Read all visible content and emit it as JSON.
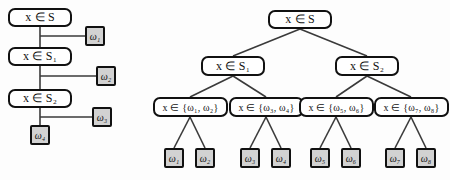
{
  "figure": {
    "background_color": "#fdfdfd",
    "ink_color": "#111111",
    "leaf_fill_color": "#d2d2d2",
    "node_fill_color": "#ffffff"
  },
  "left_tree": {
    "name": "degenerate-cascade-tree",
    "edge_style": "orthogonal",
    "decision_nodes": [
      {
        "id": "L-d1",
        "label": "x ∈ S",
        "var": "x",
        "op": "∈",
        "set": "S",
        "sub": ""
      },
      {
        "id": "L-d2",
        "label": "x ∈ S₁",
        "var": "x",
        "op": "∈",
        "set": "S",
        "sub": "1"
      },
      {
        "id": "L-d3",
        "label": "x ∈ S₂",
        "var": "x",
        "op": "∈",
        "set": "S",
        "sub": "2"
      }
    ],
    "leaves": [
      {
        "id": "L-w1",
        "label": "ω₁",
        "sym": "ω",
        "sub": "1"
      },
      {
        "id": "L-w2",
        "label": "ω₂",
        "sym": "ω",
        "sub": "2"
      },
      {
        "id": "L-w3",
        "label": "ω₃",
        "sym": "ω",
        "sub": "3"
      },
      {
        "id": "L-w4",
        "label": "ω₄",
        "sym": "ω",
        "sub": "4"
      }
    ]
  },
  "right_tree": {
    "name": "balanced-binary-tree",
    "edge_style": "diagonal",
    "root": {
      "id": "R-root",
      "label": "x ∈ S",
      "var": "x",
      "op": "∈",
      "set": "S",
      "sub": ""
    },
    "level2": [
      {
        "id": "R-s1",
        "label": "x ∈ S₁",
        "var": "x",
        "op": "∈",
        "set": "S",
        "sub": "1"
      },
      {
        "id": "R-s2",
        "label": "x ∈ S₂",
        "var": "x",
        "op": "∈",
        "set": "S",
        "sub": "2"
      }
    ],
    "level3": [
      {
        "id": "R-g1",
        "label": "x ∈ {ω₁, ω₂}",
        "var": "x",
        "op": "∈",
        "members": [
          "1",
          "2"
        ]
      },
      {
        "id": "R-g2",
        "label": "x ∈ {ω₃, ω₄}",
        "var": "x",
        "op": "∈",
        "members": [
          "3",
          "4"
        ]
      },
      {
        "id": "R-g3",
        "label": "x ∈ {ω₅, ω₆}",
        "var": "x",
        "op": "∈",
        "members": [
          "5",
          "6"
        ]
      },
      {
        "id": "R-g4",
        "label": "x ∈ {ω₇, ω₈}",
        "var": "x",
        "op": "∈",
        "members": [
          "7",
          "8"
        ]
      }
    ],
    "leaves": [
      {
        "id": "R-w1",
        "label": "ω₁",
        "sym": "ω",
        "sub": "1"
      },
      {
        "id": "R-w2",
        "label": "ω₂",
        "sym": "ω",
        "sub": "2"
      },
      {
        "id": "R-w3",
        "label": "ω₃",
        "sym": "ω",
        "sub": "3"
      },
      {
        "id": "R-w4",
        "label": "ω₄",
        "sym": "ω",
        "sub": "4"
      },
      {
        "id": "R-w5",
        "label": "ω₅",
        "sym": "ω",
        "sub": "5"
      },
      {
        "id": "R-w6",
        "label": "ω₆",
        "sym": "ω",
        "sub": "6"
      },
      {
        "id": "R-w7",
        "label": "ω₇",
        "sym": "ω",
        "sub": "7"
      },
      {
        "id": "R-w8",
        "label": "ω₈",
        "sym": "ω",
        "sub": "8"
      }
    ]
  }
}
